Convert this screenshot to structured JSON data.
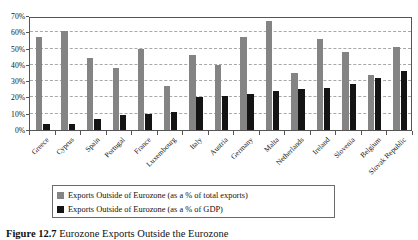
{
  "chart_data": {
    "type": "bar",
    "title": "",
    "xlabel": "",
    "ylabel": "",
    "ylim": [
      0,
      70
    ],
    "ytick_labels": [
      "70%",
      "60%",
      "50%",
      "40%",
      "30%",
      "20%",
      "10%",
      "0%"
    ],
    "ytick_values": [
      70,
      60,
      50,
      40,
      30,
      20,
      10,
      0
    ],
    "grid": true,
    "legend_position": "bottom",
    "categories": [
      "Greece",
      "Cyprus",
      "Spain",
      "Portugal",
      "France",
      "Luxembourg",
      "Italy",
      "Austria",
      "Germany",
      "Malta",
      "Netherlands",
      "Ireland",
      "Slovenia",
      "Belgium",
      "Slovak Republic"
    ],
    "series": [
      {
        "name": "Exports Outside of Eurozone (as a % of total exports)",
        "color": "#848484",
        "values": [
          57,
          61,
          44,
          38,
          50,
          27,
          46,
          40,
          57,
          67,
          35,
          56,
          48,
          34,
          51
        ]
      },
      {
        "name": "Exports Outside of Eurozone (as a % of GDP)",
        "color": "#141414",
        "values": [
          4,
          4,
          7,
          9,
          10,
          11,
          20,
          21,
          22,
          24,
          25,
          26,
          28,
          32,
          36
        ]
      }
    ]
  },
  "legend": {
    "items": [
      {
        "label": "Exports Outside of Eurozone (as a % of total exports)",
        "swatch": "gray-swatch"
      },
      {
        "label": "Exports Outside of Eurozone (as a % of GDP)",
        "swatch": "black-swatch"
      }
    ]
  },
  "caption": {
    "label": "Figure 12.7",
    "text": "Eurozone Exports Outside the Eurozone"
  }
}
